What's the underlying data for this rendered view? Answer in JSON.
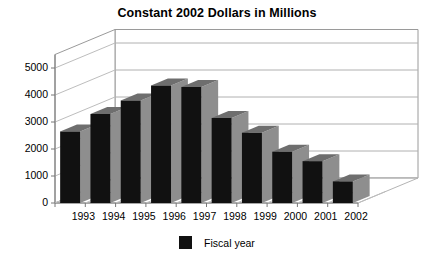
{
  "chart_data": {
    "type": "bar",
    "title": "Constant 2002 Dollars in Millions",
    "xlabel": "",
    "ylabel": "",
    "categories": [
      "1993",
      "1994",
      "1995",
      "1996",
      "1997",
      "1998",
      "1999",
      "2000",
      "2001",
      "2002"
    ],
    "values": [
      2650,
      3300,
      3800,
      4350,
      4300,
      3150,
      2600,
      1900,
      1550,
      800
    ],
    "series": [
      {
        "name": "Fiscal year",
        "color": "#111111",
        "values": [
          2650,
          3300,
          3800,
          4350,
          4300,
          3150,
          2600,
          1900,
          1550,
          800
        ]
      }
    ],
    "ylim": [
      0,
      5000
    ],
    "yticks": [
      0,
      1000,
      2000,
      3000,
      4000,
      5000
    ],
    "ytick_labels": [
      "0",
      "1000",
      "2000",
      "3000",
      "4000",
      "5000"
    ],
    "grid": true,
    "three_d": true,
    "legend": {
      "position": "bottom",
      "entries": [
        {
          "label": "Fiscal year",
          "color": "#111111"
        }
      ]
    }
  },
  "legend": {
    "swatch_name": "legend-color-swatch",
    "label": "Fiscal year"
  },
  "colors": {
    "bar_front": "#111111",
    "bar_side": "#8e8e8e",
    "bar_top": "#6e6e6e",
    "grid": "#b0b0b0",
    "axis": "#777777",
    "background": "#ffffff"
  }
}
